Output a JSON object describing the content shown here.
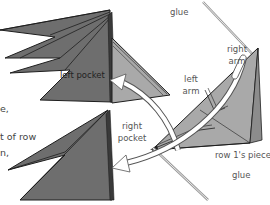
{
  "diagram": {
    "colors": {
      "dark_piece": "#6e6e6e",
      "light_piece": "#a9a9a9",
      "outline": "#1e1e1e",
      "arrow_fill": "#ffffff",
      "arrow_stroke": "#555555",
      "glue_line": "#9a9a9a",
      "text": "#555555"
    },
    "labels": {
      "left_pocket": "left pocket",
      "glue_top": "glue",
      "right_arm": [
        "right",
        "arm"
      ],
      "left_arm": [
        "left",
        "arm"
      ],
      "right_pocket": [
        "right",
        "pocket"
      ],
      "row1_piece": "row 1's piece",
      "glue_bottom": "glue"
    },
    "text_fragments": [
      "e,",
      "t of row",
      "n,"
    ],
    "arrows": [
      {
        "from": "left arm",
        "to": "left pocket"
      },
      {
        "from": "right arm",
        "to": "right pocket"
      }
    ]
  }
}
